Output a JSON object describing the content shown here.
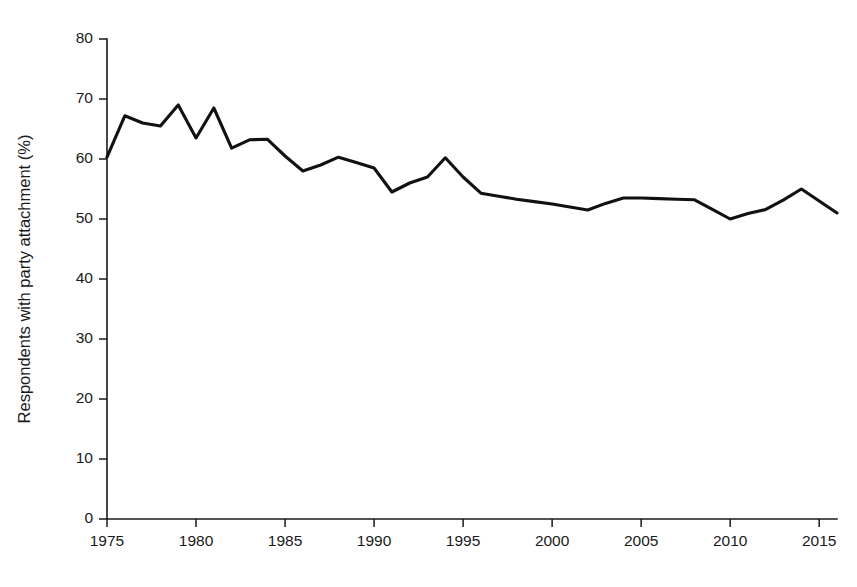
{
  "chart_data": {
    "type": "line",
    "title": "",
    "subtitle": "",
    "xlabel": "",
    "ylabel": "Respondents with party attachment (%)",
    "xlim": [
      1975,
      2016
    ],
    "ylim": [
      0,
      80
    ],
    "grid": false,
    "legend": null,
    "legend_position": "none",
    "line_color": "#111111",
    "x_tick_labels": [
      "1975",
      "1980",
      "1985",
      "1990",
      "1995",
      "2000",
      "2005",
      "2010",
      "2015"
    ],
    "x_ticks": [
      1975,
      1980,
      1985,
      1990,
      1995,
      2000,
      2005,
      2010,
      2015
    ],
    "y_tick_labels": [
      "0",
      "10",
      "20",
      "30",
      "40",
      "50",
      "60",
      "70",
      "80"
    ],
    "y_ticks": [
      0,
      10,
      20,
      30,
      40,
      50,
      60,
      70,
      80
    ],
    "series": [
      {
        "name": "Respondents with party attachment",
        "x": [
          1975,
          1976,
          1977,
          1978,
          1979,
          1980,
          1981,
          1982,
          1983,
          1984,
          1985,
          1986,
          1987,
          1988,
          1989,
          1990,
          1991,
          1992,
          1993,
          1994,
          1995,
          1996,
          1997,
          1998,
          1999,
          2000,
          2001,
          2002,
          2003,
          2004,
          2005,
          2006,
          2007,
          2008,
          2009,
          2010,
          2011,
          2012,
          2013,
          2014,
          2015,
          2016
        ],
        "values": [
          60.3,
          67.2,
          66.0,
          65.5,
          69.0,
          63.5,
          68.5,
          61.8,
          63.2,
          63.3,
          60.5,
          58.0,
          59.0,
          60.3,
          59.4,
          58.5,
          54.5,
          56.0,
          57.0,
          60.2,
          57.0,
          54.3,
          53.8,
          53.3,
          52.9,
          52.5,
          52.0,
          51.5,
          52.6,
          53.5,
          53.5,
          53.4,
          53.3,
          53.2,
          51.6,
          50.0,
          50.9,
          51.6,
          53.2,
          55.0,
          53.0,
          51.0
        ]
      }
    ]
  },
  "axis_labels": {
    "y_title": "Respondents with party attachment (%)"
  }
}
